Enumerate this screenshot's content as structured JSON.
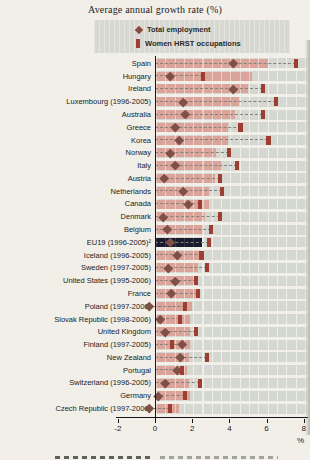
{
  "title": "Average annual growth rate (%)",
  "legend": {
    "items": [
      {
        "label": "Total employment",
        "marker": "diamond"
      },
      {
        "label": "Women HRST occupations",
        "marker": "square"
      }
    ]
  },
  "axis": {
    "unit_label": "%"
  },
  "colors": {
    "bar": "#dba49b",
    "bar_highlight": "#1b1b30",
    "women_hrst_marker": "#9e3e33",
    "total_employment_marker": "#7e5048",
    "band": "#d5d8d0",
    "legend_bg": "#d8d8d3",
    "paper": "#f1efe8"
  },
  "chart_data": {
    "type": "bar",
    "orientation": "horizontal",
    "title": "Average annual growth rate (%)",
    "xlabel": "%",
    "xlim": [
      -2,
      8.35
    ],
    "x_ticks": [
      -2,
      0,
      2,
      4,
      6,
      8
    ],
    "grid": "vertical white lines inside bands",
    "legend_position": "top",
    "marker_series": [
      {
        "name": "Total employment",
        "marker": "diamond"
      },
      {
        "name": "Women HRST occupations",
        "marker": "square"
      }
    ],
    "bar_series_note": "pink horizontal bars (EU19 bar highlighted dark navy)",
    "rows": [
      {
        "country": "Spain",
        "total_employment": 4.2,
        "women_hrst": 7.6,
        "hrst_bar": 6.1,
        "highlight": false
      },
      {
        "country": "Hungary",
        "total_employment": 0.8,
        "women_hrst": 2.6,
        "hrst_bar": 5.2,
        "highlight": false
      },
      {
        "country": "Ireland",
        "total_employment": 4.2,
        "women_hrst": 5.8,
        "hrst_bar": 5.0,
        "highlight": false
      },
      {
        "country": "Luxembourg (1996-2005)",
        "total_employment": 1.5,
        "women_hrst": 6.5,
        "hrst_bar": 4.5,
        "highlight": false
      },
      {
        "country": "Australia",
        "total_employment": 1.6,
        "women_hrst": 5.8,
        "hrst_bar": 4.3,
        "highlight": false
      },
      {
        "country": "Greece",
        "total_employment": 1.1,
        "women_hrst": 4.6,
        "hrst_bar": 3.9,
        "highlight": false
      },
      {
        "country": "Korea",
        "total_employment": 1.3,
        "women_hrst": 6.1,
        "hrst_bar": 3.9,
        "highlight": false
      },
      {
        "country": "Norway",
        "total_employment": 0.8,
        "women_hrst": 4.0,
        "hrst_bar": 3.3,
        "highlight": false
      },
      {
        "country": "Italy",
        "total_employment": 1.1,
        "women_hrst": 4.4,
        "hrst_bar": 3.6,
        "highlight": false
      },
      {
        "country": "Austria",
        "total_employment": 0.5,
        "women_hrst": 3.5,
        "hrst_bar": 3.2,
        "highlight": false
      },
      {
        "country": "Netherlands",
        "total_employment": 1.5,
        "women_hrst": 3.6,
        "hrst_bar": 2.9,
        "highlight": false
      },
      {
        "country": "Canada",
        "total_employment": 1.8,
        "women_hrst": 2.4,
        "hrst_bar": 2.9,
        "highlight": false
      },
      {
        "country": "Denmark",
        "total_employment": 0.45,
        "women_hrst": 3.5,
        "hrst_bar": 2.7,
        "highlight": false
      },
      {
        "country": "Belgium",
        "total_employment": 0.65,
        "women_hrst": 3.0,
        "hrst_bar": 2.6,
        "highlight": false
      },
      {
        "country": "EU19 (1996-2005)²",
        "total_employment": 0.8,
        "women_hrst": 2.9,
        "hrst_bar": 2.55,
        "highlight": true
      },
      {
        "country": "Iceland (1996-2005)",
        "total_employment": 1.2,
        "women_hrst": 2.5,
        "hrst_bar": 2.5,
        "highlight": false
      },
      {
        "country": "Sweden (1997-2005)",
        "total_employment": 0.7,
        "women_hrst": 2.8,
        "hrst_bar": 2.3,
        "highlight": false
      },
      {
        "country": "United States (1995-2006)",
        "total_employment": 1.1,
        "women_hrst": 2.2,
        "hrst_bar": 2.2,
        "highlight": false
      },
      {
        "country": "France",
        "total_employment": 0.9,
        "women_hrst": 2.3,
        "hrst_bar": 2.2,
        "highlight": false
      },
      {
        "country": "Poland (1997-2006)",
        "total_employment": -0.3,
        "women_hrst": 1.6,
        "hrst_bar": 2.0,
        "highlight": false
      },
      {
        "country": "Slovak Republic (1998-2006)",
        "total_employment": 0.3,
        "women_hrst": 1.35,
        "hrst_bar": 1.9,
        "highlight": false
      },
      {
        "country": "United Kingdom",
        "total_employment": 0.55,
        "women_hrst": 2.2,
        "hrst_bar": 1.9,
        "highlight": false
      },
      {
        "country": "Finland (1997-2005)",
        "total_employment": 1.45,
        "women_hrst": 0.9,
        "hrst_bar": 1.9,
        "highlight": false
      },
      {
        "country": "New Zealand",
        "total_employment": 1.35,
        "women_hrst": 2.8,
        "hrst_bar": 1.85,
        "highlight": false
      },
      {
        "country": "Portugal",
        "total_employment": 1.2,
        "women_hrst": 1.45,
        "hrst_bar": 1.7,
        "highlight": false
      },
      {
        "country": "Switzerland (1996-2005)",
        "total_employment": 0.55,
        "women_hrst": 2.4,
        "hrst_bar": 1.85,
        "highlight": false
      },
      {
        "country": "Germany",
        "total_employment": 0.15,
        "women_hrst": 1.6,
        "hrst_bar": 1.9,
        "highlight": false
      },
      {
        "country": "Czech Republic (1997-2006)",
        "total_employment": -0.3,
        "women_hrst": 0.8,
        "hrst_bar": 1.3,
        "highlight": false
      }
    ]
  }
}
